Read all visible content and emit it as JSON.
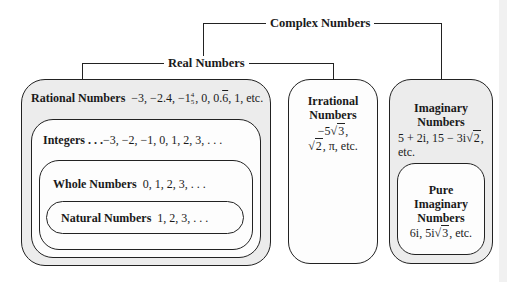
{
  "diagram": {
    "title": "Complex Numbers",
    "real": {
      "label": "Real Numbers"
    },
    "rational": {
      "label": "Rational Numbers",
      "examples": "−3, −2.4, −1",
      "frac_num": "4",
      "frac_den": "5",
      "examples_after_frac": ", 0, 0.",
      "repeat_digit": "6",
      "examples_tail": ", 1, etc."
    },
    "integers": {
      "label": "Integers",
      "ellipsis": ". . .",
      "examples": "−3, −2, −1, 0, 1, 2, 3, . . ."
    },
    "whole": {
      "label": "Whole Numbers",
      "examples": "0, 1, 2, 3, . . ."
    },
    "natural": {
      "label": "Natural Numbers",
      "examples": "1, 2, 3, . . ."
    },
    "irrational": {
      "label_line1": "Irrational",
      "label_line2": "Numbers",
      "ex1_prefix": "−5√",
      "ex1_radicand": "3",
      "ex1_suffix": ",",
      "ex2_prefix": "√",
      "ex2_radicand": "2",
      "ex2_suffix": ", π, etc."
    },
    "imaginary": {
      "label_line1": "Imaginary",
      "label_line2": "Numbers",
      "ex1": "5 + 2i, 15 − 3i√",
      "ex1_radicand": "2",
      "ex1_suffix": ",",
      "ex2": "etc."
    },
    "pure_imaginary": {
      "label_line1": "Pure",
      "label_line2": "Imaginary",
      "label_line3": "Numbers",
      "ex_prefix": "6i, 5i√",
      "ex_radicand": "3",
      "ex_suffix": ", etc."
    }
  },
  "colors": {
    "line": "#222222",
    "grey_fill": "#ececec",
    "white_fill": "#fdfdfd"
  }
}
